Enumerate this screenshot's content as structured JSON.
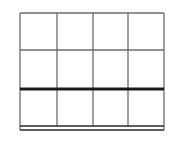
{
  "diagram": {
    "type": "table-grid",
    "columns": 4,
    "rows": 3,
    "line_color": "#6b6b6b",
    "emphasis_color": "#1a1a1a",
    "background": "#ffffff",
    "frame": {
      "left": 20,
      "top": 13,
      "right": 164,
      "bottom": 126
    },
    "column_lines_x": [
      57,
      93,
      128
    ],
    "row_lines": [
      {
        "y": 50,
        "style": "thin"
      },
      {
        "y": 89,
        "style": "thick"
      }
    ],
    "bottom_border": {
      "style": "double",
      "y1": 126,
      "y2": 130
    },
    "cells": [
      [
        "",
        "",
        "",
        ""
      ],
      [
        "",
        "",
        "",
        ""
      ],
      [
        "",
        "",
        "",
        ""
      ]
    ]
  }
}
